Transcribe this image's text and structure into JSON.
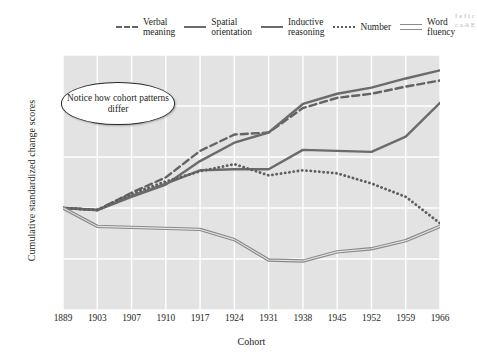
{
  "chart_data": {
    "type": "line",
    "title": "",
    "xlabel": "Cohort",
    "ylabel": "Cumulative standardized change scores",
    "categories": [
      "1889",
      "1903",
      "1907",
      "1910",
      "1917",
      "1924",
      "1931",
      "1938",
      "1945",
      "1952",
      "1959",
      "1966"
    ],
    "x": [
      1889,
      1903,
      1907,
      1910,
      1917,
      1924,
      1931,
      1938,
      1945,
      1952,
      1959,
      1966
    ],
    "ylim": [
      -10,
      15
    ],
    "yticks": [
      15,
      10,
      5,
      0,
      -5,
      -10
    ],
    "grid": true,
    "legend_position": "top",
    "series": [
      {
        "name": "Verbal meaning",
        "style": "dashed",
        "color": "#636363",
        "values": [
          0,
          -0.2,
          1.5,
          3.0,
          5.6,
          7.2,
          7.4,
          9.8,
          10.8,
          11.2,
          11.9,
          12.5
        ]
      },
      {
        "name": "Spatial orientation",
        "style": "solid",
        "color": "#6b6b6b",
        "values": [
          0,
          -0.2,
          1.1,
          2.3,
          4.6,
          6.4,
          7.4,
          10.2,
          11.2,
          11.8,
          12.7,
          13.5
        ]
      },
      {
        "name": "Inductive reasoning",
        "style": "solid",
        "color": "#6b6b6b",
        "values": [
          0,
          -0.2,
          1.2,
          2.4,
          3.7,
          3.8,
          3.8,
          5.7,
          5.6,
          5.5,
          7.0,
          10.3
        ]
      },
      {
        "name": "Number",
        "style": "dotted",
        "color": "#5e5e5e",
        "values": [
          0,
          -0.2,
          1.4,
          2.6,
          3.6,
          4.3,
          3.2,
          3.7,
          3.4,
          2.4,
          1.1,
          -1.5
        ]
      },
      {
        "name": "Word fluency",
        "style": "double",
        "color": "#8a8a8a",
        "values": [
          0,
          -1.8,
          -1.9,
          -2.0,
          -2.1,
          -3.1,
          -5.1,
          -5.2,
          -4.3,
          -4.0,
          -3.2,
          -1.8
        ]
      }
    ],
    "annotation": "Notice how cohort patterns differ"
  },
  "legend": {
    "items": [
      {
        "label_line1": "Verbal",
        "label_line2": "meaning",
        "key": "dashed-line-key"
      },
      {
        "label_line1": "Spatial",
        "label_line2": "orientation",
        "key": "solid-line-key"
      },
      {
        "label_line1": "Inductive",
        "label_line2": "reasoning",
        "key": "solid-line-key"
      },
      {
        "label_line1": "Number",
        "label_line2": "",
        "key": "dotted-line-key"
      },
      {
        "label_line1": "Word",
        "label_line2": "fluency",
        "key": "double-line-key"
      }
    ]
  },
  "edge_text": "f e f i c c a A E"
}
